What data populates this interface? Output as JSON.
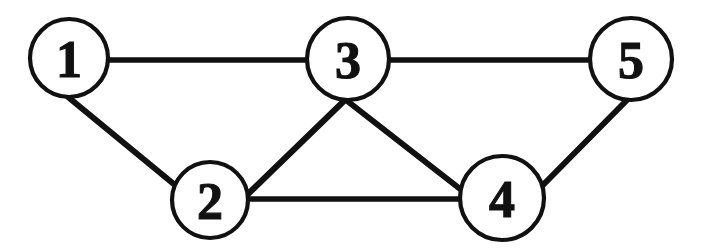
{
  "figure": {
    "kind": "undirected-graph-diagram",
    "background_color": "#ffffff",
    "stroke_color": "#111111",
    "width": 705,
    "height": 252
  },
  "graph": {
    "nodes": [
      {
        "id": "1",
        "label": "1",
        "cx": 69,
        "cy": 58,
        "r": 39
      },
      {
        "id": "2",
        "label": "2",
        "cx": 210,
        "cy": 200,
        "r": 38
      },
      {
        "id": "3",
        "label": "3",
        "cx": 348,
        "cy": 59,
        "r": 41
      },
      {
        "id": "4",
        "label": "4",
        "cx": 502,
        "cy": 198,
        "r": 42
      },
      {
        "id": "5",
        "label": "5",
        "cx": 631,
        "cy": 59,
        "r": 41
      }
    ],
    "edges": [
      {
        "from": "1",
        "to": "3",
        "x1": 108,
        "y1": 60,
        "x2": 307,
        "y2": 60,
        "orientation": "horizontal"
      },
      {
        "from": "3",
        "to": "5",
        "x1": 390,
        "y1": 60,
        "x2": 590,
        "y2": 60,
        "orientation": "horizontal"
      },
      {
        "from": "2",
        "to": "4",
        "x1": 248,
        "y1": 199,
        "x2": 460,
        "y2": 199,
        "orientation": "horizontal"
      },
      {
        "from": "1",
        "to": "2",
        "x1": 68,
        "y1": 97,
        "x2": 181,
        "y2": 190,
        "orientation": "diagonal"
      },
      {
        "from": "2",
        "to": "3",
        "x1": 246,
        "y1": 196,
        "x2": 345,
        "y2": 100,
        "orientation": "diagonal"
      },
      {
        "from": "3",
        "to": "4",
        "x1": 346,
        "y1": 100,
        "x2": 464,
        "y2": 192,
        "orientation": "diagonal"
      },
      {
        "from": "4",
        "to": "5",
        "x1": 542,
        "y1": 186,
        "x2": 628,
        "y2": 99,
        "orientation": "diagonal"
      }
    ]
  }
}
